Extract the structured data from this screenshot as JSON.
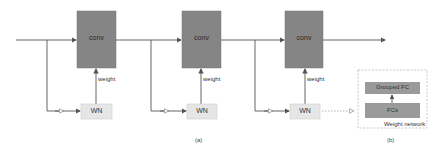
{
  "diagram": {
    "blocks": [
      {
        "conv_label": "conv",
        "weight_label": "weight",
        "wn_label": "WN"
      },
      {
        "conv_label": "conv",
        "weight_label": "weight",
        "wn_label": "WN"
      },
      {
        "conv_label": "conv",
        "weight_label": "weight",
        "wn_label": "WN"
      }
    ],
    "weight_network": {
      "title": "Weight network",
      "top_layer": "Grouped FC",
      "bottom_layer": "FCs"
    },
    "captions": {
      "a": "(a)",
      "b": "(b)"
    },
    "colors": {
      "conv_fill": "#858585",
      "wn_fill": "#e6e6e6",
      "fc_fill": "#9a9a9a",
      "line": "#555555",
      "dashed": "#bbbbbb"
    }
  }
}
